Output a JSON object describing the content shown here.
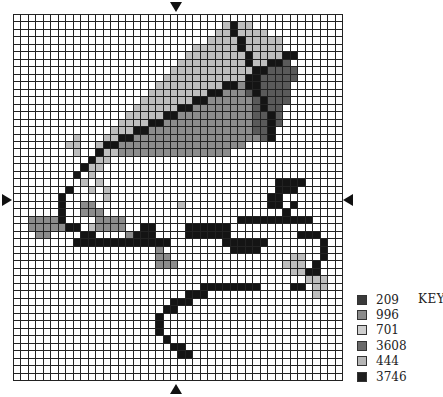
{
  "pattern": {
    "columns": 44,
    "rows_count": 49,
    "palette": {
      "K": "#141414",
      "D": "#5a5a5a",
      "M": "#8c8c8c",
      "L": "#bebebe",
      ".": "#ffffff"
    },
    "rows": [
      "............................................",
      "............................LKLL............",
      "...........................LLKLLLL..........",
      "..........................LLLLKLLLLL........",
      "........................LLLLLLKLLLLL........",
      ".......................LLLLLLLLKLLLLKK......",
      "......................LLLLLLLLLKLLKKD.......",
      ".....................LLLLLLLLLLLKKDDDD......",
      "....................LLLLLLLLLLLKKDDDDD......",
      "...................LLLLLLLLLKKMKKDDDD.......",
      "..................LLLLLLLLKKMMMDKDDDD.......",
      ".................LLLLLLLKKMMMMMMDKDDD.......",
      "................LLLLLLKKMMMMMMMMDKDD........",
      "...............LLLLLKKMMMMMMMMMMDDKD........",
      "..............LLLLKKMMMMMMMMMMMMDDKD........",
      ".............LLLKKMMMMMMMMMMMMMMDDK.........",
      "........L...LLKKMMMMMMMMMMMMMMMMMDK.........",
      ".......LL..LKKMMMMMMMMMMMMMMMMM.............",
      "........L..KLLMMMMMMMMMMMMMMM...............",
      "..........KLL...............................",
      ".........KLL................................",
      "........K.L.................................",
      ".........L.L.......................KKKK.....",
      ".......K..L.L......................KKK......",
      "......K.....L.....................KK........",
      "......K..MM...........L...........KK.K......",
      "......K..MMM........................K.......",
      "..MMMMK....MMMM...............KKKKKKKKKK....",
      "..MMMMMKK.LMMMM..KK....KKKKKK...............",
      "...MM....KK....MKKK....KKKKKK.........KKK...",
      "........KKKKKKKKKKKKK.......KKKKKK.......K..",
      "...................M.........KKKK........K..",
      "...................MM................LL..K..",
      "...................MMM..............LLL.K...",
      ".....................................LLKK....",
      ".......................................LLL..",
      ".........................KKKKKKKK....KK.LL..",
      ".......................KKK..............L...",
      ".....................KKK....................",
      "....................KK......................",
      "...................K........................",
      "...................K........................",
      "...................K........................",
      "....................K.......................",
      ".....................KK.....................",
      "......................KK....................",
      "............................................",
      "............................................",
      "............................................"
    ]
  },
  "markers": {
    "top": "center-marker-top",
    "bottom": "center-marker-bottom",
    "left": "center-marker-left",
    "right": "center-marker-right"
  },
  "key": {
    "title": "KEY",
    "items": [
      {
        "code": "209",
        "color": "#3a3a3a"
      },
      {
        "code": "996",
        "color": "#8a8a8a"
      },
      {
        "code": "701",
        "color": "#cfcfcf"
      },
      {
        "code": "3608",
        "color": "#6a6a6a"
      },
      {
        "code": "444",
        "color": "#b5b5b5"
      },
      {
        "code": "3746",
        "color": "#1e1e1e"
      }
    ]
  }
}
